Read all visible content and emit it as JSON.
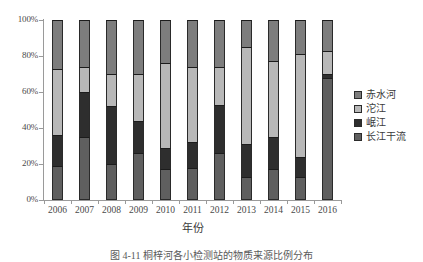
{
  "chart_data": {
    "type": "bar",
    "subtype": "100% stacked column",
    "title": "",
    "xlabel": "年份",
    "ylabel": "",
    "ylim": [
      0,
      100
    ],
    "ytick_labels": [
      "0%",
      "20%",
      "40%",
      "60%",
      "80%",
      "100%"
    ],
    "ytick_values": [
      0,
      20,
      40,
      60,
      80,
      100
    ],
    "grid": false,
    "legend_position": "right",
    "categories": [
      "2006",
      "2007",
      "2008",
      "2009",
      "2010",
      "2011",
      "2012",
      "2013",
      "2014",
      "2015",
      "2016"
    ],
    "stack_order_bottom_to_top": [
      "长江干流",
      "岷江",
      "沱江",
      "赤水河"
    ],
    "series": [
      {
        "name": "长江干流",
        "color": "#5f5f5f",
        "values": [
          19,
          35,
          20,
          26,
          17,
          18,
          26,
          13,
          17,
          13,
          68
        ]
      },
      {
        "name": "岷江",
        "color": "#2e2e2e",
        "values": [
          17,
          25,
          32,
          18,
          12,
          14,
          27,
          18,
          18,
          11,
          2
        ]
      },
      {
        "name": "沱江",
        "color": "#b8b8b8",
        "values": [
          37,
          14,
          18,
          26,
          47,
          42,
          21,
          54,
          42,
          57,
          13
        ]
      },
      {
        "name": "赤水河",
        "color": "#7d7d7d",
        "values": [
          27,
          26,
          30,
          30,
          24,
          26,
          26,
          15,
          23,
          19,
          17
        ]
      }
    ]
  },
  "legend": {
    "items": [
      {
        "label": "赤水河",
        "color": "#7d7d7d"
      },
      {
        "label": "沱江",
        "color": "#b8b8b8"
      },
      {
        "label": "岷江",
        "color": "#2e2e2e"
      },
      {
        "label": "长江干流",
        "color": "#5f5f5f"
      }
    ]
  },
  "axis": {
    "x_title": "年份"
  },
  "caption": {
    "text": "图 4-11  桐梓河各小检测站的物质来源比例分布"
  }
}
